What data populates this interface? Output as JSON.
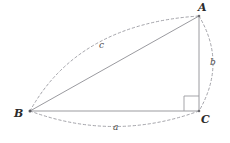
{
  "figure": {
    "background_color": "#ffffff",
    "stroke_color": "#8f8f94",
    "dash_color": "#9a9aa0",
    "label_color": "#2b2b2b",
    "side_label_color": "#4a4a4a",
    "width": 230,
    "height": 143
  },
  "vertices": [
    {
      "name": "A",
      "label": "A",
      "x": 199,
      "y": 16,
      "label_x": 198,
      "label_y": 2
    },
    {
      "name": "B",
      "label": "B",
      "x": 30,
      "y": 111,
      "label_x": 14,
      "label_y": 108
    },
    {
      "name": "C",
      "label": "C",
      "x": 199,
      "y": 111,
      "label_x": 201,
      "label_y": 114
    }
  ],
  "sides": [
    {
      "name": "hypotenuse",
      "label": "c",
      "from": "B",
      "to": "A",
      "label_x": 99,
      "label_y": 41
    },
    {
      "name": "vertical-leg",
      "label": "b",
      "from": "A",
      "to": "C",
      "label_x": 210,
      "label_y": 58
    },
    {
      "name": "horizontal-leg",
      "label": "a",
      "from": "B",
      "to": "C",
      "label_x": 113,
      "label_y": 123
    }
  ],
  "right_angle": {
    "at_vertex": "C",
    "size": 15,
    "x": 184,
    "y": 96
  },
  "arcs": [
    {
      "name": "arc-c",
      "for_side": "c",
      "path": "M 30 111 Q 78 24 199 16"
    },
    {
      "name": "arc-b",
      "for_side": "b",
      "path": "M 199 16 Q 227 63 199 111"
    },
    {
      "name": "arc-a",
      "for_side": "a",
      "path": "M 30 111 Q 114 142 199 111"
    }
  ]
}
